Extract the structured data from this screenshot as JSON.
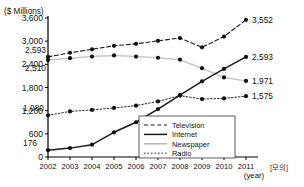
{
  "chart_data": {
    "type": "line",
    "title": "",
    "unit_label": "($ Millions)",
    "xlabel": "(year)",
    "ylabel": "",
    "categories": [
      "2002",
      "2003",
      "2004",
      "2005",
      "2006",
      "2007",
      "2008",
      "2009",
      "2010",
      "2011"
    ],
    "x": [
      2002,
      2003,
      2004,
      2005,
      2006,
      2007,
      2008,
      2009,
      2010,
      2011
    ],
    "ylim": [
      0,
      3600
    ],
    "yticks": [
      "0",
      "600",
      "1,200",
      "1,800",
      "2,400",
      "3,000",
      "3,600"
    ],
    "ytick_values": [
      0,
      600,
      1200,
      1800,
      2400,
      3000,
      3600
    ],
    "grid": false,
    "legend_position": "bottom-right",
    "series": [
      {
        "name": "Television",
        "style": "dashed",
        "values": [
          2593,
          2700,
          2790,
          2880,
          2930,
          3010,
          3080,
          2840,
          3120,
          3552
        ],
        "start_label": "2,593",
        "end_label": "3,552"
      },
      {
        "name": "Internet",
        "style": "solid",
        "values": [
          176,
          230,
          320,
          640,
          900,
          1240,
          1600,
          1960,
          2280,
          2593
        ],
        "start_label": "176",
        "end_label": "2,593"
      },
      {
        "name": "Newspaper",
        "style": "light-solid",
        "values": [
          2510,
          2560,
          2600,
          2630,
          2600,
          2570,
          2520,
          2300,
          2060,
          1971
        ],
        "start_label": "2,510",
        "end_label": "1,971"
      },
      {
        "name": "Radio",
        "style": "dotted",
        "values": [
          1080,
          1180,
          1220,
          1270,
          1330,
          1440,
          1590,
          1500,
          1520,
          1575
        ],
        "start_label": "1,080",
        "end_label": "1,575"
      }
    ]
  },
  "legend": {
    "items": [
      {
        "label": "Television"
      },
      {
        "label": "Internet"
      },
      {
        "label": "Newspaper"
      },
      {
        "label": "Radio"
      }
    ]
  },
  "watermark": {
    "text": "[모의]"
  }
}
